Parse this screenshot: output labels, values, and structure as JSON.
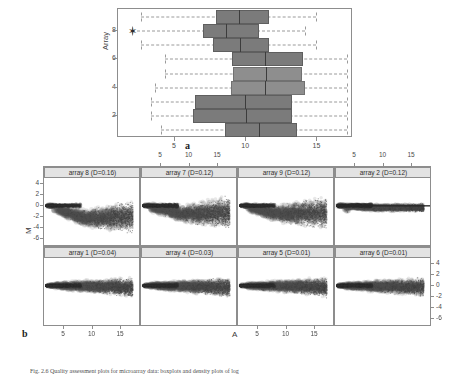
{
  "figure": {
    "panel_a_letter": "a",
    "panel_b_letter": "b",
    "caption": "Fig. 2.6 Quality assessment plots for microarray data: boxplots and density plots of log"
  },
  "panel_a": {
    "name": "boxplot-intensity-distributions",
    "y_axis_label": "Array",
    "y_ticks": [
      "2",
      "4",
      "6",
      "8"
    ],
    "x_ticks": [
      "5",
      "10",
      "15"
    ],
    "x_range": [
      1.0,
      17.5
    ],
    "y_range": [
      0.4,
      9.6
    ],
    "outlier_marker": "star",
    "boxes": [
      {
        "array": 1,
        "lower_whisker": 4.0,
        "q1": 8.5,
        "median": 10.9,
        "q3": 13.6,
        "upper_whisker": 17.1,
        "shade": "dark",
        "outlier": null
      },
      {
        "array": 2,
        "lower_whisker": 3.3,
        "q1": 6.3,
        "median": 10.0,
        "q3": 13.2,
        "upper_whisker": 17.1,
        "shade": "dark",
        "outlier": null
      },
      {
        "array": 3,
        "lower_whisker": 3.3,
        "q1": 6.4,
        "median": 9.9,
        "q3": 13.2,
        "upper_whisker": 17.1,
        "shade": "dark",
        "outlier": null
      },
      {
        "array": 4,
        "lower_whisker": 3.6,
        "q1": 8.9,
        "median": 11.3,
        "q3": 14.1,
        "upper_whisker": 17.1,
        "shade": "light",
        "outlier": null
      },
      {
        "array": 5,
        "lower_whisker": 4.3,
        "q1": 9.1,
        "median": 11.4,
        "q3": 13.9,
        "upper_whisker": 17.1,
        "shade": "light",
        "outlier": null
      },
      {
        "array": 6,
        "lower_whisker": 4.3,
        "q1": 9.0,
        "median": 11.3,
        "q3": 14.0,
        "upper_whisker": 17.1,
        "shade": "dark",
        "outlier": null
      },
      {
        "array": 7,
        "lower_whisker": 2.6,
        "q1": 7.7,
        "median": 9.6,
        "q3": 11.6,
        "upper_whisker": 14.9,
        "shade": "dark",
        "outlier": null
      },
      {
        "array": 8,
        "lower_whisker": 2.0,
        "q1": 7.0,
        "median": 8.6,
        "q3": 10.9,
        "upper_whisker": 14.1,
        "shade": "dark",
        "outlier": 2.0
      },
      {
        "array": 9,
        "lower_whisker": 2.6,
        "q1": 7.9,
        "median": 9.5,
        "q3": 11.6,
        "upper_whisker": 14.9,
        "shade": "dark",
        "outlier": null
      }
    ]
  },
  "panel_b": {
    "name": "ma-density-lattice",
    "x_axis_label": "A",
    "y_axis_label": "M",
    "x_ticks": [
      "5",
      "10",
      "15"
    ],
    "y_ticks": [
      "4",
      "2",
      "0",
      "-2",
      "-4",
      "-6"
    ],
    "x_range": [
      1.5,
      18.5
    ],
    "y_range": [
      -7.5,
      5.0
    ],
    "panels": [
      {
        "row": 0,
        "col": 0,
        "title": "array 8 (D=0.16)",
        "array": 8,
        "D": 0.16
      },
      {
        "row": 0,
        "col": 1,
        "title": "array 7 (D=0.12)",
        "array": 7,
        "D": 0.12
      },
      {
        "row": 0,
        "col": 2,
        "title": "array 9 (D=0.12)",
        "array": 9,
        "D": 0.12
      },
      {
        "row": 0,
        "col": 3,
        "title": "array 2 (D=0.12)",
        "array": 2,
        "D": 0.12
      },
      {
        "row": 1,
        "col": 0,
        "title": "array 1 (D=0.04)",
        "array": 1,
        "D": 0.04
      },
      {
        "row": 1,
        "col": 1,
        "title": "array 4 (D=0.03)",
        "array": 4,
        "D": 0.03
      },
      {
        "row": 1,
        "col": 2,
        "title": "array 5 (D=0.01)",
        "array": 5,
        "D": 0.01
      },
      {
        "row": 1,
        "col": 3,
        "title": "array 6 (D=0.01)",
        "array": 6,
        "D": 0.01
      }
    ]
  },
  "chart_data": {
    "type": "scatter",
    "title": "",
    "subtitle": "",
    "charts": [
      {
        "type": "bar",
        "orientation": "horizontal",
        "subtype": "boxplot",
        "title": "",
        "xlabel": "",
        "ylabel": "Array",
        "xlim": [
          1.0,
          17.5
        ],
        "ylim": [
          0.4,
          9.6
        ],
        "grid": false,
        "categories": [
          "1",
          "2",
          "3",
          "4",
          "5",
          "6",
          "7",
          "8",
          "9"
        ],
        "series": [
          {
            "name": "lower_whisker",
            "values": [
              4.0,
              3.3,
              3.3,
              3.6,
              4.3,
              4.3,
              2.6,
              2.0,
              2.6
            ]
          },
          {
            "name": "q1",
            "values": [
              8.5,
              6.3,
              6.4,
              8.9,
              9.1,
              9.0,
              7.7,
              7.0,
              7.9
            ]
          },
          {
            "name": "median",
            "values": [
              10.9,
              10.0,
              9.9,
              11.3,
              11.4,
              11.3,
              9.6,
              8.6,
              9.5
            ]
          },
          {
            "name": "q3",
            "values": [
              13.6,
              13.2,
              13.2,
              14.1,
              13.9,
              14.0,
              11.6,
              10.9,
              11.6
            ]
          },
          {
            "name": "upper_whisker",
            "values": [
              17.1,
              17.1,
              17.1,
              17.1,
              17.1,
              17.1,
              14.9,
              14.1,
              14.9
            ]
          }
        ],
        "annotations": [
          "star outlier at array 8, A=2.0"
        ]
      },
      {
        "type": "scatter",
        "subtype": "MA-density",
        "title": "",
        "xlabel": "A",
        "ylabel": "M",
        "xlim": [
          1.5,
          18.5
        ],
        "ylim": [
          -7.5,
          5.0
        ],
        "grid": false,
        "legend_position": "strip-top",
        "facets": [
          {
            "label": "array 8 (D=0.16)",
            "D": 0.16
          },
          {
            "label": "array 7 (D=0.12)",
            "D": 0.12
          },
          {
            "label": "array 9 (D=0.12)",
            "D": 0.12
          },
          {
            "label": "array 2 (D=0.12)",
            "D": 0.12
          },
          {
            "label": "array 1 (D=0.04)",
            "D": 0.04
          },
          {
            "label": "array 4 (D=0.03)",
            "D": 0.03
          },
          {
            "label": "array 5 (D=0.01)",
            "D": 0.01
          },
          {
            "label": "array 6 (D=0.01)",
            "D": 0.01
          }
        ]
      }
    ]
  }
}
